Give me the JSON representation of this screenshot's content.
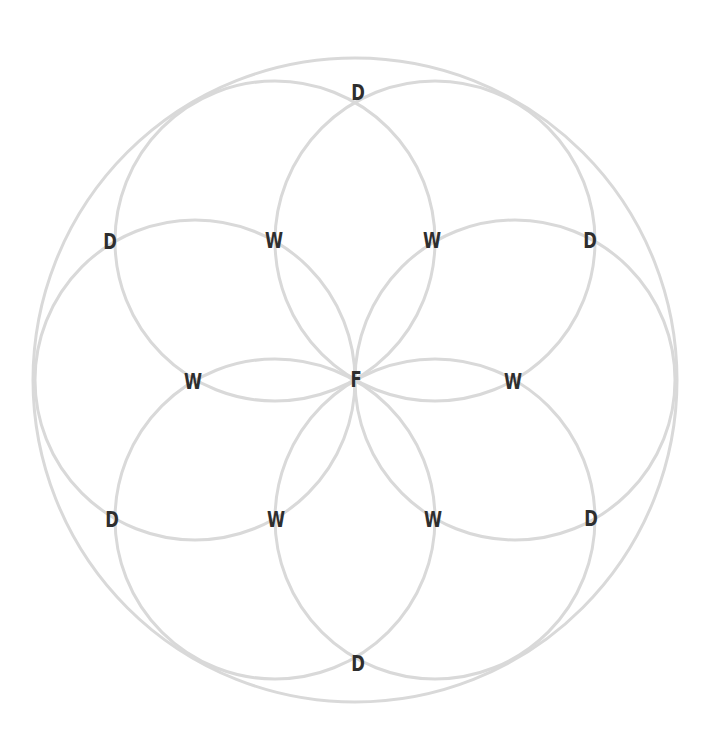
{
  "diagram": {
    "type": "seed-of-life",
    "line_color": "#d9d9d9",
    "label_color": "#2e2e2e",
    "background": "#ffffff",
    "center": {
      "x": 355,
      "y": 380
    },
    "outer_circle": {
      "cx": 355,
      "cy": 380,
      "r": 322
    },
    "petal_radius": 160,
    "petal_circles": [
      {
        "cx": 195,
        "cy": 380
      },
      {
        "cx": 515,
        "cy": 380
      },
      {
        "cx": 275,
        "cy": 241
      },
      {
        "cx": 435,
        "cy": 241
      },
      {
        "cx": 275,
        "cy": 519
      },
      {
        "cx": 435,
        "cy": 519
      }
    ],
    "nodes": [
      {
        "id": "F",
        "label": "F",
        "x": 356,
        "y": 380
      },
      {
        "id": "W1",
        "label": "W",
        "x": 193,
        "y": 382
      },
      {
        "id": "W2",
        "label": "W",
        "x": 513,
        "y": 382
      },
      {
        "id": "W3",
        "label": "W",
        "x": 274,
        "y": 241
      },
      {
        "id": "W4",
        "label": "W",
        "x": 432,
        "y": 241
      },
      {
        "id": "W5",
        "label": "W",
        "x": 276,
        "y": 520
      },
      {
        "id": "W6",
        "label": "W",
        "x": 433,
        "y": 520
      },
      {
        "id": "D1",
        "label": "D",
        "x": 358,
        "y": 93
      },
      {
        "id": "D2",
        "label": "D",
        "x": 110,
        "y": 242
      },
      {
        "id": "D3",
        "label": "D",
        "x": 590,
        "y": 241
      },
      {
        "id": "D4",
        "label": "D",
        "x": 112,
        "y": 520
      },
      {
        "id": "D5",
        "label": "D",
        "x": 591,
        "y": 519
      },
      {
        "id": "D6",
        "label": "D",
        "x": 358,
        "y": 664
      }
    ]
  }
}
